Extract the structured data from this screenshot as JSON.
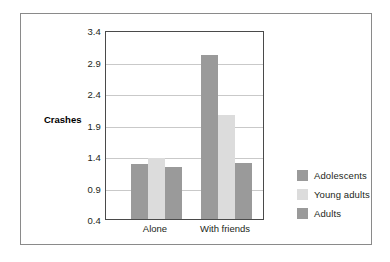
{
  "chart_data": {
    "type": "bar",
    "title": "",
    "xlabel": "",
    "ylabel": "Crashes",
    "categories": [
      "Alone",
      "With friends"
    ],
    "series": [
      {
        "name": "Adolescents",
        "color": "#9a9a9a",
        "values": [
          1.27,
          3.01
        ]
      },
      {
        "name": "Young adults",
        "color": "#dcdcdc",
        "values": [
          1.37,
          2.05
        ]
      },
      {
        "name": "Adults",
        "color": "#9a9a9a",
        "values": [
          1.23,
          1.29
        ]
      }
    ],
    "ylim": [
      0.4,
      3.4
    ],
    "yticks": [
      "0.4",
      "0.9",
      "1.4",
      "1.9",
      "2.4",
      "2.9",
      "3.4"
    ],
    "ytick_values": [
      0.4,
      0.9,
      1.4,
      1.9,
      2.4,
      2.9,
      3.4
    ],
    "grid": true,
    "legend_position": "right",
    "colors": {
      "adolescents": "#9a9a9a",
      "young_adults": "#dcdcdc",
      "adults": "#9a9a9a",
      "gridline": "#c9c9c9",
      "axis": "#4a4a4a",
      "frame": "#8a8a8a",
      "text": "#231f20",
      "background": "#ffffff"
    }
  }
}
